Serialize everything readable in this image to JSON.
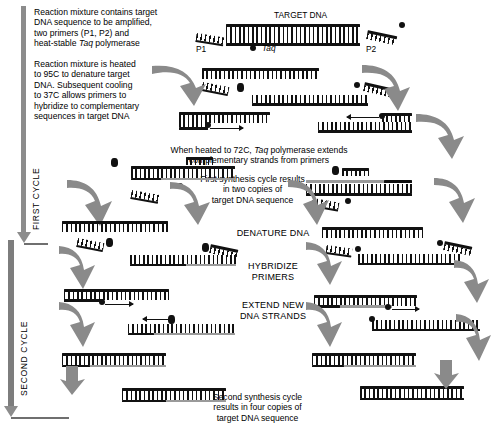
{
  "figure": {
    "colors": {
      "dna_template": "#111111",
      "new_strand": "#9a9a9a",
      "process_arrow": "#8a8a8a",
      "background": "#ffffff"
    }
  },
  "captions": {
    "intro": "Reaction mixture contains target\nDNA sequence to be amplified,\ntwo primers (P1, P2) and\nheat-stable Taq polymerase",
    "intro_italic_word": "Taq",
    "denature": "Reaction mixture is heated\nto 95C to denature target\nDNA. Subsequent cooling\nto 37C allows primers to\nhybridize to complementary\nsequences in target DNA",
    "extend": "When heated to 72C, Taq polymerase extends\ncomplementary strands from primers",
    "extend_italic_word": "Taq",
    "first_result": "First synthesis cycle results\nin two copies of\ntarget DNA sequence",
    "second_result": "Second synthesis cycle\nresults in four copies of\ntarget DNA sequence"
  },
  "steps": {
    "denature_dna": "DENATURE\nDNA",
    "hybridize_primers": "HYBRIDIZE\nPRIMERS",
    "extend_new_strands": "EXTEND\nNEW DNA\nSTRANDS"
  },
  "cycle_labels": {
    "first": "FIRST CYCLE",
    "second": "SECOND CYCLE"
  },
  "diagram_labels": {
    "target_dna": "TARGET DNA",
    "primer_1": "P1",
    "primer_2": "P2",
    "taq": "Taq"
  },
  "icons": {
    "taq_polymerase": "taq-polymerase-blob",
    "primer": "primer-comb",
    "dna_strand": "dna-strand-comb",
    "process_arrow": "curved-process-arrow",
    "cycle_arrow": "long-down-arrow"
  }
}
